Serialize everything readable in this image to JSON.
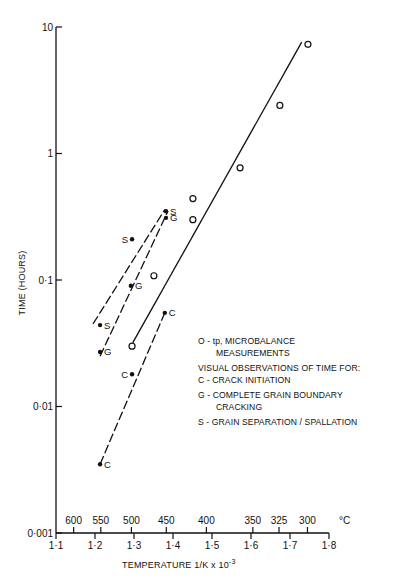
{
  "chart_data": {
    "type": "scatter",
    "title": "",
    "xlabel": "TEMPERATURE 1/K x 10",
    "xlabel_exponent": "-3",
    "ylabel": "TIME (HOURS)",
    "yscale": "log",
    "xlim": [
      1.1,
      1.8
    ],
    "ylim": [
      0.001,
      10
    ],
    "x_ticks": [
      {
        "value": 1.1,
        "label": "1·1"
      },
      {
        "value": 1.2,
        "label": "1·2"
      },
      {
        "value": 1.3,
        "label": "1·3"
      },
      {
        "value": 1.4,
        "label": "1·4"
      },
      {
        "value": 1.5,
        "label": "1·5"
      },
      {
        "value": 1.6,
        "label": "1·6"
      },
      {
        "value": 1.7,
        "label": "1·7"
      },
      {
        "value": 1.8,
        "label": "1·8"
      }
    ],
    "y_ticks": [
      {
        "value": 10,
        "label": "10"
      },
      {
        "value": 1,
        "label": "1"
      },
      {
        "value": 0.1,
        "label": "0·1"
      },
      {
        "value": 0.01,
        "label": "0·01"
      },
      {
        "value": 0.001,
        "label": "0·001"
      }
    ],
    "secondary_x_axis": {
      "unit": "°C",
      "ticks": [
        {
          "celsius": 600,
          "label": "600"
        },
        {
          "celsius": 550,
          "label": "550"
        },
        {
          "celsius": 500,
          "label": "500"
        },
        {
          "celsius": 450,
          "label": "450"
        },
        {
          "celsius": 400,
          "label": "400"
        },
        {
          "celsius": 350,
          "label": "350"
        },
        {
          "celsius": 325,
          "label": "325"
        },
        {
          "celsius": 300,
          "label": "300"
        }
      ]
    },
    "grid": false,
    "series": [
      {
        "name": "tp, MICROBALANCE MEASUREMENTS",
        "marker": "open-circle",
        "label": "",
        "points": [
          {
            "x": 1.295,
            "y": 0.03
          },
          {
            "x": 1.351,
            "y": 0.108
          },
          {
            "x": 1.451,
            "y": 0.3
          },
          {
            "x": 1.451,
            "y": 0.44
          },
          {
            "x": 1.572,
            "y": 0.77
          },
          {
            "x": 1.674,
            "y": 2.4
          },
          {
            "x": 1.746,
            "y": 7.3
          }
        ],
        "fit_line": {
          "style": "solid",
          "from": {
            "x": 1.297,
            "y": 0.032
          },
          "to": {
            "x": 1.73,
            "y": 7.6
          }
        }
      },
      {
        "name": "GRAIN SEPARATION / SPALLATION",
        "marker": "filled-dot",
        "label": "S",
        "points": [
          {
            "x": 1.213,
            "y": 0.044
          },
          {
            "x": 1.295,
            "y": 0.21
          },
          {
            "x": 1.382,
            "y": 0.35
          }
        ],
        "fit_line": {
          "style": "dashed",
          "from": {
            "x": 1.195,
            "y": 0.045
          },
          "to": {
            "x": 1.379,
            "y": 0.36
          }
        }
      },
      {
        "name": "COMPLETE GRAIN BOUNDARY CRACKING",
        "marker": "filled-dot",
        "label": "G",
        "points": [
          {
            "x": 1.213,
            "y": 0.027
          },
          {
            "x": 1.292,
            "y": 0.09
          },
          {
            "x": 1.382,
            "y": 0.31
          }
        ],
        "fit_line": {
          "style": "dashed",
          "from": {
            "x": 1.213,
            "y": 0.025
          },
          "to": {
            "x": 1.387,
            "y": 0.35
          }
        }
      },
      {
        "name": "CRACK INITIATION",
        "marker": "filled-dot",
        "label": "C",
        "points": [
          {
            "x": 1.213,
            "y": 0.0035
          },
          {
            "x": 1.295,
            "y": 0.018
          },
          {
            "x": 1.379,
            "y": 0.055
          }
        ],
        "fit_line": {
          "style": "dashed",
          "from": {
            "x": 1.213,
            "y": 0.0035
          },
          "to": {
            "x": 1.379,
            "y": 0.055
          }
        }
      }
    ],
    "legend": {
      "placement": "center-right",
      "lines": [
        {
          "text": "O - tp, MICROBALANCE",
          "indent": false
        },
        {
          "text": "MEASUREMENTS",
          "indent": true
        },
        {
          "text": "VISUAL OBSERVATIONS OF TIME FOR:",
          "indent": false
        },
        {
          "text": "C - CRACK  INITIATION",
          "indent": false
        },
        {
          "text": "G - COMPLETE GRAIN BOUNDARY",
          "indent": false
        },
        {
          "text": "CRACKING",
          "indent": true
        },
        {
          "text": "S - GRAIN  SEPARATION / SPALLATION",
          "indent": false
        }
      ]
    }
  }
}
